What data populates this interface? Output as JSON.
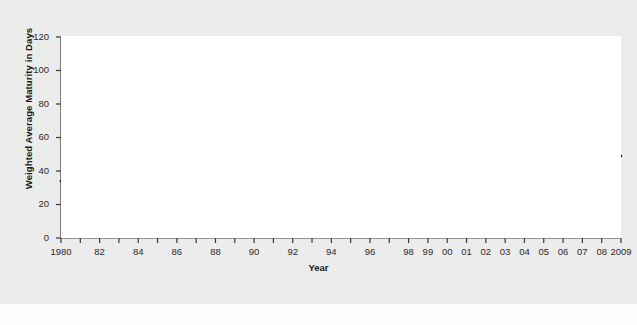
{
  "figure": {
    "background_color": "#ececec",
    "plot_background_color": "#ffffff",
    "line_color": "#231f20",
    "axis_color": "#3a3a3a"
  },
  "chart_data": {
    "type": "line",
    "title": "",
    "xlabel": "Year",
    "ylabel": "Weighted Average Maturity in Days",
    "xlim": [
      1980,
      2009
    ],
    "ylim": [
      0,
      120
    ],
    "grid": false,
    "legend": null,
    "y_ticks": [
      0,
      20,
      40,
      60,
      80,
      100,
      120
    ],
    "y_tick_labels": [
      "0",
      "20",
      "40",
      "60",
      "80",
      "100",
      "120"
    ],
    "x_ticks": [
      1980,
      1981,
      1982,
      1983,
      1984,
      1985,
      1986,
      1987,
      1988,
      1989,
      1990,
      1991,
      1992,
      1993,
      1994,
      1995,
      1996,
      1997,
      1998,
      1999,
      2000,
      2001,
      2002,
      2003,
      2004,
      2005,
      2006,
      2007,
      2008,
      2009
    ],
    "x_tick_labels": [
      {
        "year": 1980,
        "label": "1980"
      },
      {
        "year": 1982,
        "label": "82"
      },
      {
        "year": 1984,
        "label": "84"
      },
      {
        "year": 1986,
        "label": "86"
      },
      {
        "year": 1988,
        "label": "88"
      },
      {
        "year": 1990,
        "label": "90"
      },
      {
        "year": 1992,
        "label": "92"
      },
      {
        "year": 1994,
        "label": "94"
      },
      {
        "year": 1996,
        "label": "96"
      },
      {
        "year": 1998,
        "label": "98"
      },
      {
        "year": 1999,
        "label": "99"
      },
      {
        "year": 2000,
        "label": "00"
      },
      {
        "year": 2001,
        "label": "01"
      },
      {
        "year": 2002,
        "label": "02"
      },
      {
        "year": 2003,
        "label": "03"
      },
      {
        "year": 2004,
        "label": "04"
      },
      {
        "year": 2005,
        "label": "05"
      },
      {
        "year": 2006,
        "label": "06"
      },
      {
        "year": 2007,
        "label": "07"
      },
      {
        "year": 2008,
        "label": "08"
      },
      {
        "year": 2009,
        "label": "2009"
      }
    ],
    "x": [
      1980,
      1981,
      1982,
      1983,
      1984,
      1985,
      1986,
      1987,
      1988,
      1989,
      1990,
      1991,
      1992,
      1993,
      1994,
      1995,
      1996,
      1997,
      1998,
      1999,
      2000,
      2001,
      2002,
      2003,
      2004,
      2005,
      2006,
      2007,
      2008,
      2009
    ],
    "values": [
      34,
      37,
      38,
      37,
      43,
      38,
      37,
      29,
      33,
      39,
      47,
      50,
      49,
      47,
      31,
      53,
      45,
      44,
      45,
      47,
      49,
      59,
      54,
      58,
      41,
      35,
      44,
      42,
      45,
      49
    ],
    "series": [
      {
        "name": "Weighted Average Maturity in Days",
        "values": [
          34,
          37,
          38,
          37,
          43,
          38,
          37,
          29,
          33,
          39,
          47,
          50,
          49,
          47,
          31,
          53,
          45,
          44,
          45,
          47,
          49,
          59,
          54,
          58,
          41,
          35,
          44,
          42,
          45,
          49
        ]
      }
    ]
  }
}
